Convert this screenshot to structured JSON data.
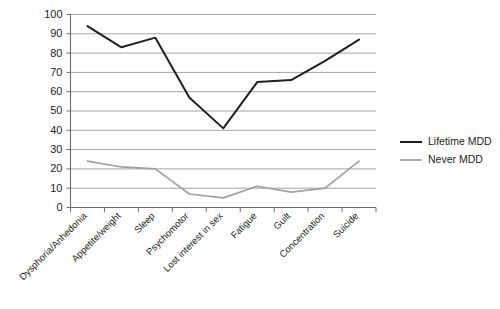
{
  "chart_data": {
    "type": "line",
    "title": "",
    "subtitle": "",
    "xlabel": "",
    "ylabel": "",
    "ylim": [
      0,
      100
    ],
    "ytick_step": 10,
    "yticks": [
      0,
      10,
      20,
      30,
      40,
      50,
      60,
      70,
      80,
      90,
      100
    ],
    "grid": "horizontal",
    "legend_position": "right",
    "categories": [
      "Dysphoria/Anhedonia",
      "Appetite/weight",
      "Sleep",
      "Psychomotor",
      "Lost interest in sex",
      "Fatigue",
      "Guilt",
      "Concentration",
      "Suicide"
    ],
    "series": [
      {
        "name": "Lifetime MDD",
        "color": "#231f20",
        "values": [
          94,
          83,
          88,
          57,
          41,
          65,
          66,
          76,
          87
        ]
      },
      {
        "name": "Never MDD",
        "color": "#a0a0a0",
        "values": [
          24,
          21,
          20,
          7,
          5,
          11,
          8,
          10,
          24
        ]
      }
    ]
  },
  "legend": {
    "items": [
      {
        "label": "Lifetime MDD",
        "color": "#231f20"
      },
      {
        "label": "Never MDD",
        "color": "#a0a0a0"
      }
    ]
  },
  "axis": {
    "y_labels": [
      "100",
      "90",
      "80",
      "70",
      "60",
      "50",
      "40",
      "30",
      "20",
      "10",
      "0"
    ]
  }
}
